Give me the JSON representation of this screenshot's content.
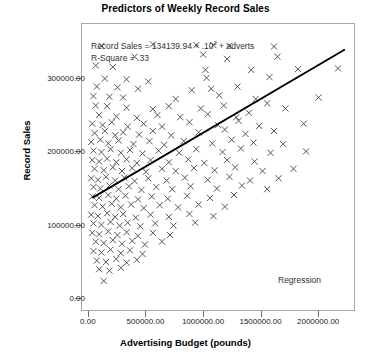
{
  "chart_data": {
    "type": "scatter",
    "title": "Predictors of Weekly Record Sales",
    "xlabel": "Advertising Budget (pounds)",
    "ylabel": "Record Sales",
    "xlim": [
      -60000,
      2320000
    ],
    "ylim": [
      -18000,
      375000
    ],
    "grid": false,
    "xticks": [
      0,
      500000,
      1000000,
      1500000,
      2000000
    ],
    "xtick_labels": [
      "0.00",
      "500000.00",
      "1000000.00",
      "1500000.00",
      "2000000.00"
    ],
    "yticks": [
      0,
      100000,
      200000,
      300000
    ],
    "ytick_labels": [
      "0.00",
      "100000.00",
      "200000.00",
      "300000.00"
    ],
    "marker": "x",
    "marker_color": "#555555",
    "annotations": [
      {
        "name": "equation",
        "text": "Record Sales = 134139.94 + .10",
        "superscript": "2",
        "text_tail": " + adverts"
      },
      {
        "name": "r-square",
        "text": "R-Square = .33"
      },
      {
        "name": "regression-legend",
        "text": "Regression"
      }
    ],
    "fit_line": {
      "name": "Regression",
      "color": "#000000",
      "x_start": 30000,
      "y_start": 136000,
      "x_end": 2240000,
      "y_end": 340000
    },
    "points": [
      [
        110000,
        345000
      ],
      [
        560000,
        347000
      ],
      [
        940000,
        346000
      ],
      [
        1090000,
        346000
      ],
      [
        1230000,
        345000
      ],
      [
        1620000,
        344000
      ],
      [
        400000,
        330000
      ],
      [
        1000000,
        333000
      ],
      [
        1210000,
        327000
      ],
      [
        1650000,
        330000
      ],
      [
        60000,
        318000
      ],
      [
        210000,
        316000
      ],
      [
        1020000,
        312000
      ],
      [
        1420000,
        312000
      ],
      [
        1830000,
        313000
      ],
      [
        2180000,
        314000
      ],
      [
        140000,
        300000
      ],
      [
        330000,
        299000
      ],
      [
        520000,
        296000
      ],
      [
        1030000,
        301000
      ],
      [
        1580000,
        302000
      ],
      [
        70000,
        289000
      ],
      [
        250000,
        288000
      ],
      [
        430000,
        286000
      ],
      [
        900000,
        284000
      ],
      [
        1070000,
        286000
      ],
      [
        1300000,
        289000
      ],
      [
        40000,
        276000
      ],
      [
        180000,
        275000
      ],
      [
        300000,
        274000
      ],
      [
        760000,
        272000
      ],
      [
        1140000,
        277000
      ],
      [
        1460000,
        272000
      ],
      [
        2010000,
        274000
      ],
      [
        60000,
        263000
      ],
      [
        160000,
        262000
      ],
      [
        330000,
        260000
      ],
      [
        560000,
        258000
      ],
      [
        700000,
        262000
      ],
      [
        980000,
        259000
      ],
      [
        1180000,
        263000
      ],
      [
        1560000,
        266000
      ],
      [
        1720000,
        259000
      ],
      [
        90000,
        250000
      ],
      [
        240000,
        248000
      ],
      [
        420000,
        246000
      ],
      [
        600000,
        250000
      ],
      [
        800000,
        247000
      ],
      [
        1040000,
        251000
      ],
      [
        1290000,
        247000
      ],
      [
        1400000,
        253000
      ],
      [
        30000,
        238000
      ],
      [
        120000,
        236000
      ],
      [
        200000,
        240000
      ],
      [
        340000,
        234000
      ],
      [
        480000,
        238000
      ],
      [
        640000,
        234000
      ],
      [
        880000,
        240000
      ],
      [
        1130000,
        236000
      ],
      [
        1310000,
        242000
      ],
      [
        1490000,
        235000
      ],
      [
        1880000,
        238000
      ],
      [
        50000,
        225000
      ],
      [
        140000,
        228000
      ],
      [
        230000,
        222000
      ],
      [
        300000,
        226000
      ],
      [
        440000,
        223000
      ],
      [
        560000,
        228000
      ],
      [
        720000,
        222000
      ],
      [
        960000,
        226000
      ],
      [
        1190000,
        230000
      ],
      [
        1370000,
        224000
      ],
      [
        1620000,
        228000
      ],
      [
        20000,
        213000
      ],
      [
        100000,
        216000
      ],
      [
        170000,
        211000
      ],
      [
        260000,
        215000
      ],
      [
        390000,
        210000
      ],
      [
        530000,
        214000
      ],
      [
        660000,
        209000
      ],
      [
        830000,
        214000
      ],
      [
        1080000,
        211000
      ],
      [
        1250000,
        216000
      ],
      [
        1440000,
        212000
      ],
      [
        1700000,
        210000
      ],
      [
        40000,
        201000
      ],
      [
        110000,
        199000
      ],
      [
        190000,
        203000
      ],
      [
        280000,
        198000
      ],
      [
        360000,
        202000
      ],
      [
        470000,
        197000
      ],
      [
        610000,
        201000
      ],
      [
        790000,
        198000
      ],
      [
        940000,
        203000
      ],
      [
        1170000,
        199000
      ],
      [
        1330000,
        204000
      ],
      [
        1590000,
        198000
      ],
      [
        1900000,
        200000
      ],
      [
        30000,
        188000
      ],
      [
        90000,
        186000
      ],
      [
        160000,
        190000
      ],
      [
        240000,
        185000
      ],
      [
        330000,
        189000
      ],
      [
        420000,
        184000
      ],
      [
        540000,
        188000
      ],
      [
        700000,
        185000
      ],
      [
        870000,
        189000
      ],
      [
        1010000,
        184000
      ],
      [
        1210000,
        188000
      ],
      [
        1450000,
        186000
      ],
      [
        50000,
        176000
      ],
      [
        130000,
        174000
      ],
      [
        210000,
        178000
      ],
      [
        290000,
        173000
      ],
      [
        380000,
        177000
      ],
      [
        500000,
        172000
      ],
      [
        640000,
        176000
      ],
      [
        760000,
        173000
      ],
      [
        920000,
        177000
      ],
      [
        1100000,
        174000
      ],
      [
        1280000,
        178000
      ],
      [
        1520000,
        173000
      ],
      [
        1790000,
        176000
      ],
      [
        20000,
        163000
      ],
      [
        80000,
        161000
      ],
      [
        150000,
        165000
      ],
      [
        230000,
        160000
      ],
      [
        310000,
        164000
      ],
      [
        400000,
        159000
      ],
      [
        520000,
        163000
      ],
      [
        680000,
        160000
      ],
      [
        840000,
        164000
      ],
      [
        1040000,
        161000
      ],
      [
        1230000,
        165000
      ],
      [
        1410000,
        160000
      ],
      [
        1660000,
        163000
      ],
      [
        40000,
        151000
      ],
      [
        100000,
        149000
      ],
      [
        180000,
        153000
      ],
      [
        260000,
        148000
      ],
      [
        350000,
        152000
      ],
      [
        460000,
        147000
      ],
      [
        590000,
        151000
      ],
      [
        730000,
        148000
      ],
      [
        890000,
        152000
      ],
      [
        1120000,
        149000
      ],
      [
        1340000,
        153000
      ],
      [
        1560000,
        148000
      ],
      [
        30000,
        138000
      ],
      [
        90000,
        136000
      ],
      [
        170000,
        140000
      ],
      [
        240000,
        135000
      ],
      [
        320000,
        139000
      ],
      [
        430000,
        134000
      ],
      [
        550000,
        138000
      ],
      [
        690000,
        135000
      ],
      [
        860000,
        139000
      ],
      [
        1060000,
        136000
      ],
      [
        1270000,
        140000
      ],
      [
        50000,
        126000
      ],
      [
        120000,
        124000
      ],
      [
        200000,
        128000
      ],
      [
        280000,
        123000
      ],
      [
        370000,
        127000
      ],
      [
        480000,
        122000
      ],
      [
        620000,
        126000
      ],
      [
        780000,
        123000
      ],
      [
        960000,
        127000
      ],
      [
        1190000,
        124000
      ],
      [
        20000,
        113000
      ],
      [
        80000,
        111000
      ],
      [
        160000,
        115000
      ],
      [
        230000,
        110000
      ],
      [
        300000,
        114000
      ],
      [
        410000,
        109000
      ],
      [
        540000,
        113000
      ],
      [
        700000,
        110000
      ],
      [
        880000,
        114000
      ],
      [
        1090000,
        111000
      ],
      [
        40000,
        101000
      ],
      [
        110000,
        99000
      ],
      [
        190000,
        103000
      ],
      [
        270000,
        98000
      ],
      [
        340000,
        102000
      ],
      [
        450000,
        97000
      ],
      [
        580000,
        101000
      ],
      [
        740000,
        98000
      ],
      [
        930000,
        102000
      ],
      [
        30000,
        88000
      ],
      [
        90000,
        86000
      ],
      [
        170000,
        90000
      ],
      [
        250000,
        85000
      ],
      [
        330000,
        89000
      ],
      [
        430000,
        84000
      ],
      [
        560000,
        88000
      ],
      [
        710000,
        85000
      ],
      [
        60000,
        76000
      ],
      [
        130000,
        74000
      ],
      [
        210000,
        78000
      ],
      [
        290000,
        73000
      ],
      [
        380000,
        77000
      ],
      [
        490000,
        72000
      ],
      [
        640000,
        76000
      ],
      [
        40000,
        63000
      ],
      [
        110000,
        61000
      ],
      [
        190000,
        65000
      ],
      [
        280000,
        60000
      ],
      [
        360000,
        64000
      ],
      [
        470000,
        59000
      ],
      [
        70000,
        50000
      ],
      [
        150000,
        48000
      ],
      [
        240000,
        52000
      ],
      [
        330000,
        47000
      ],
      [
        420000,
        51000
      ],
      [
        90000,
        38000
      ],
      [
        180000,
        36000
      ],
      [
        280000,
        40000
      ],
      [
        130000,
        22000
      ]
    ]
  }
}
